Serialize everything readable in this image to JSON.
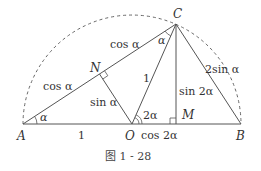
{
  "figure": {
    "caption": "图 1 - 28",
    "points": {
      "A": "A",
      "B": "B",
      "C": "C",
      "O": "O",
      "M": "M",
      "N": "N"
    },
    "labels": {
      "AN": "cos α",
      "NC": "cos α",
      "ON": "sin α",
      "OC": "1",
      "CM": "sin 2α",
      "CB": "2sin α",
      "AO": "1",
      "OM": "cos 2α",
      "angle_A": "α",
      "angle_C": "α",
      "angle_O": "2α"
    },
    "colors": {
      "line": "#555555",
      "text": "#333333",
      "arc": "#666666"
    }
  }
}
